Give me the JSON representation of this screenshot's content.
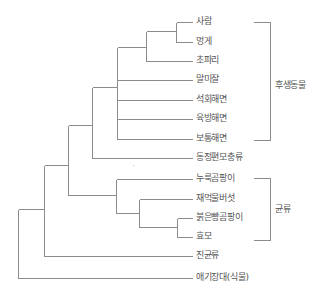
{
  "diagram": {
    "type": "phylogenetic-tree",
    "colors": {
      "line": "#8c8c8c",
      "text": "#555555"
    },
    "leaves": [
      {
        "id": "human",
        "label": "사람",
        "y": 22,
        "x_start": 176
      },
      {
        "id": "sea-squirt",
        "label": "멍게",
        "y": 42,
        "x_start": 176
      },
      {
        "id": "fruit-fly",
        "label": "초파리",
        "y": 61,
        "x_start": 146
      },
      {
        "id": "sea-anemone",
        "label": "말미잘",
        "y": 80,
        "x_start": 117
      },
      {
        "id": "calcareous-sponge",
        "label": "석회해면",
        "y": 100,
        "x_start": 117
      },
      {
        "id": "glass-sponge",
        "label": "육방해면",
        "y": 119,
        "x_start": 117
      },
      {
        "id": "demosponge",
        "label": "보통해면",
        "y": 139,
        "x_start": 117
      },
      {
        "id": "choanoflagellate",
        "label": "동정편모충류",
        "y": 158,
        "x_start": 92
      },
      {
        "id": "aspergillus",
        "label": "누룩곰팡이",
        "y": 179,
        "x_start": 116
      },
      {
        "id": "coprinus",
        "label": "재먹물버섯",
        "y": 199,
        "x_start": 139
      },
      {
        "id": "neurospora",
        "label": "붉은빵곰팡이",
        "y": 218,
        "x_start": 177
      },
      {
        "id": "yeast",
        "label": "효모",
        "y": 237,
        "x_start": 177
      },
      {
        "id": "chytrid",
        "label": "진균류",
        "y": 256,
        "x_start": 44
      },
      {
        "id": "arabidopsis",
        "label": "애기장대(식물)",
        "y": 278,
        "x_start": 18
      }
    ],
    "leaf_line_end_x": 192,
    "leaf_label_x": 196,
    "internal_nodes": [
      {
        "x": 176,
        "y_top": 22,
        "y_bottom": 42,
        "parent_x": 146,
        "parent_y": 31
      },
      {
        "x": 146,
        "y_top": 31,
        "y_bottom": 61,
        "parent_x": 117,
        "parent_y": 47
      },
      {
        "x": 117,
        "y_top": 47,
        "y_bottom": 139,
        "parent_x": 92,
        "parent_y": 87
      },
      {
        "x": 92,
        "y_top": 87,
        "y_bottom": 158,
        "parent_x": 68,
        "parent_y": 125
      },
      {
        "x": 177,
        "y_top": 218,
        "y_bottom": 237,
        "parent_x": 139,
        "parent_y": 227
      },
      {
        "x": 139,
        "y_top": 199,
        "y_bottom": 227,
        "parent_x": 116,
        "parent_y": 213
      },
      {
        "x": 116,
        "y_top": 179,
        "y_bottom": 213,
        "parent_x": 68,
        "parent_y": 195
      },
      {
        "x": 68,
        "y_top": 125,
        "y_bottom": 195,
        "parent_x": 44,
        "parent_y": 165
      },
      {
        "x": 44,
        "y_top": 165,
        "y_bottom": 256,
        "parent_x": 18,
        "parent_y": 209
      },
      {
        "x": 18,
        "y_top": 209,
        "y_bottom": 278,
        "parent_x": null,
        "parent_y": null
      }
    ],
    "groups": [
      {
        "id": "metazoa",
        "label": "후생동물",
        "x_left": 253,
        "x_right": 270,
        "y_top": 22,
        "y_bottom": 140,
        "label_x": 275,
        "label_y": 80
      },
      {
        "id": "fungi",
        "label": "균류",
        "x_left": 253,
        "x_right": 270,
        "y_top": 178,
        "y_bottom": 240,
        "label_x": 275,
        "label_y": 204
      }
    ],
    "artifact_dot": {
      "x": 133,
      "y": 165
    }
  }
}
